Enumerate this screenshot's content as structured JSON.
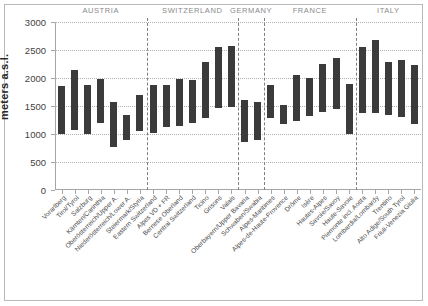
{
  "chart_data": {
    "type": "bar",
    "title": "",
    "subtitle": "",
    "xlabel": "",
    "ylabel": "meters a.s.l.",
    "ylim": [
      0,
      3000
    ],
    "ytick_step": 500,
    "yticks": [
      "0",
      "500",
      "1000",
      "1500",
      "2000",
      "2500",
      "3000"
    ],
    "grid": true,
    "legend": "none",
    "bar_color": "#3b3b3b",
    "note": "Floating (range) bars: each bar spans a minimum and maximum elevation in meters above sea level.",
    "categories": [
      "Vorarlberg",
      "Tirol/Tyrol",
      "Salzburg",
      "Kärnten/Carinthia",
      "Oberösterreich/Upper A.",
      "Niederösterreich/Lower A.",
      "Steiermark/Styria",
      "Eastern Switzerland",
      "Alpes VD + FR",
      "Bernese Oberland",
      "Central Switzerland",
      "Ticino",
      "Grisons",
      "Valais",
      "Oberbayern/Upper Bavaria",
      "Schwaben/Swabia",
      "Alpes-Maritimes",
      "Alpes-de-Haute-Provence",
      "Drôme",
      "Isère",
      "Hautes-Alpes",
      "Savoie/Savoy",
      "Haute-Savoie",
      "Piemonte incl. Aosta",
      "Lombardia/Lombardy",
      "Trentino",
      "Alto Adige/South Tyrol",
      "Friuli-Venezia Giulia"
    ],
    "series": [
      {
        "name": "Elevation range (min)",
        "values": [
          1000,
          1080,
          1000,
          1190,
          770,
          900,
          1050,
          1020,
          1120,
          1150,
          1190,
          1280,
          1470,
          1480,
          860,
          900,
          1280,
          1170,
          1240,
          1320,
          1400,
          1450,
          1000,
          1370,
          1380,
          1340,
          1310,
          1180
        ]
      },
      {
        "name": "Elevation range (max)",
        "values": [
          1850,
          2150,
          1870,
          1990,
          1570,
          1340,
          1690,
          1870,
          1880,
          1980,
          1970,
          2280,
          2550,
          2580,
          1600,
          1580,
          1880,
          1510,
          2060,
          2000,
          2250,
          2360,
          1900,
          2560,
          2680,
          2280,
          2320,
          2240
        ]
      }
    ],
    "groups": [
      {
        "label": "AUSTRIA",
        "start_index": 0,
        "end_index": 6
      },
      {
        "label": "SWITZERLAND",
        "start_index": 7,
        "end_index": 13
      },
      {
        "label": "GERMANY",
        "start_index": 14,
        "end_index": 15
      },
      {
        "label": "FRANCE",
        "start_index": 16,
        "end_index": 22
      },
      {
        "label": "ITALY",
        "start_index": 23,
        "end_index": 27
      }
    ]
  }
}
